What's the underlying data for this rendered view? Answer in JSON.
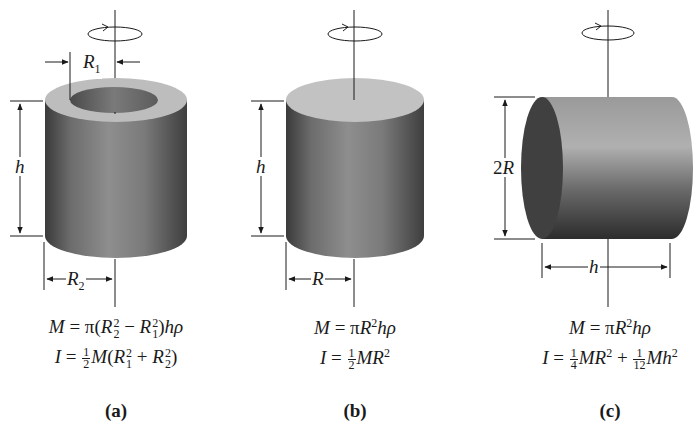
{
  "figure": {
    "panels": [
      {
        "id": "a",
        "caption": "(a)",
        "shape": "hollow cylinder",
        "labels": {
          "inner_radius": "R",
          "inner_radius_sub": "1",
          "outer_radius": "R",
          "outer_radius_sub": "2",
          "height": "h"
        },
        "equations": {
          "mass": "M = π(R₂² − R₁²)hρ",
          "inertia": "I = ½M(R₁² + R₂²)"
        }
      },
      {
        "id": "b",
        "caption": "(b)",
        "shape": "solid cylinder (axis along length)",
        "labels": {
          "radius": "R",
          "height": "h"
        },
        "equations": {
          "mass": "M = πR²hρ",
          "inertia": "I = ½MR²"
        }
      },
      {
        "id": "c",
        "caption": "(c)",
        "shape": "solid cylinder (axis through center, perpendicular)",
        "labels": {
          "diameter": "2R",
          "length": "h"
        },
        "equations": {
          "mass": "M = πR²hρ",
          "inertia": "I = ¼MR² + 1⁄12Mh²"
        }
      }
    ],
    "rotation_icon": "rotation-arrow-icon"
  }
}
